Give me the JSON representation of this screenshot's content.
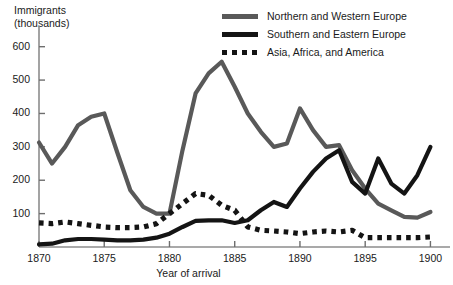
{
  "chart_data": {
    "type": "line",
    "title": "",
    "ylabel": "Immigrants\n(thousands)",
    "xlabel": "Year of arrival",
    "xlim": [
      1870,
      1901.5
    ],
    "ylim": [
      0,
      650
    ],
    "xticks": [
      1870,
      1875,
      1880,
      1885,
      1890,
      1895,
      1900
    ],
    "xtick_labels": [
      "1870",
      "1875",
      "1880",
      "1885",
      "1890",
      "1895",
      "1900"
    ],
    "yticks": [
      100,
      200,
      300,
      400,
      500,
      600
    ],
    "ytick_labels": [
      "100",
      "200",
      "300",
      "400",
      "500",
      "600"
    ],
    "grid": false,
    "legend_position": "top-right",
    "series": [
      {
        "name": "Northern and Western Europe",
        "style": "solid",
        "color": "#595959",
        "x": [
          1870,
          1871,
          1872,
          1873,
          1874,
          1875,
          1876,
          1877,
          1878,
          1879,
          1880,
          1881,
          1882,
          1883,
          1884,
          1885,
          1886,
          1887,
          1888,
          1889,
          1890,
          1891,
          1892,
          1893,
          1894,
          1895,
          1896,
          1897,
          1898,
          1899,
          1900
        ],
        "values": [
          313,
          250,
          300,
          365,
          390,
          400,
          283,
          170,
          120,
          100,
          100,
          290,
          460,
          520,
          555,
          480,
          400,
          345,
          300,
          310,
          415,
          350,
          300,
          305,
          230,
          175,
          130,
          110,
          90,
          88,
          105
        ]
      },
      {
        "name": "Southern and Eastern Europe",
        "style": "solid",
        "color": "#141414",
        "x": [
          1870,
          1871,
          1872,
          1873,
          1874,
          1875,
          1876,
          1877,
          1878,
          1879,
          1880,
          1881,
          1882,
          1883,
          1884,
          1885,
          1886,
          1887,
          1888,
          1889,
          1890,
          1891,
          1892,
          1893,
          1894,
          1895,
          1896,
          1897,
          1898,
          1899,
          1900
        ],
        "values": [
          8,
          10,
          20,
          24,
          24,
          22,
          20,
          20,
          22,
          28,
          40,
          60,
          78,
          80,
          80,
          72,
          80,
          110,
          135,
          120,
          175,
          225,
          265,
          290,
          195,
          160,
          265,
          190,
          160,
          215,
          300
        ]
      },
      {
        "name": "Asia, Africa, and America",
        "style": "dotted",
        "color": "#141414",
        "x": [
          1870,
          1871,
          1872,
          1873,
          1874,
          1875,
          1876,
          1877,
          1878,
          1879,
          1880,
          1881,
          1882,
          1883,
          1884,
          1885,
          1886,
          1887,
          1888,
          1889,
          1890,
          1891,
          1892,
          1893,
          1894,
          1895,
          1896,
          1897,
          1898,
          1899,
          1900
        ],
        "values": [
          72,
          70,
          75,
          70,
          65,
          60,
          58,
          58,
          60,
          70,
          100,
          130,
          160,
          155,
          125,
          110,
          60,
          50,
          48,
          45,
          40,
          45,
          48,
          45,
          50,
          28,
          28,
          28,
          28,
          28,
          30
        ]
      }
    ]
  },
  "legend": {
    "items": [
      {
        "label": "Northern and Western Europe",
        "swatch": "solid-gray"
      },
      {
        "label": "Southern and Eastern Europe",
        "swatch": "solid-black"
      },
      {
        "label": "Asia, Africa, and America",
        "swatch": "dotted"
      }
    ]
  }
}
